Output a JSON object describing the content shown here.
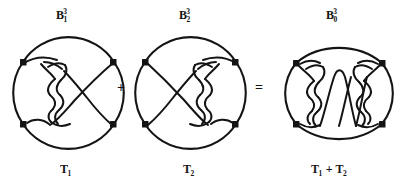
{
  "figure": {
    "kind": "knot-theory-tangle-addition-diagram",
    "background_color": "#ffffff",
    "ink_color": "#141414",
    "width": 417,
    "height": 181,
    "operators": [
      {
        "name": "plus-operator",
        "symbol": "+",
        "x": 117,
        "y": 81
      },
      {
        "name": "equals-operator",
        "symbol": "=",
        "x": 255,
        "y": 81
      }
    ],
    "panels": [
      {
        "id": "panel-1",
        "top_label": {
          "base": "B",
          "sub": "1",
          "sup": "3"
        },
        "bottom_label": {
          "base": "T",
          "sub": "1",
          "sup": ""
        },
        "shape": "circle",
        "cx": 69,
        "cy": 90,
        "rx": 54,
        "ry": 54,
        "endpoints": 4
      },
      {
        "id": "panel-2",
        "top_label": {
          "base": "B",
          "sub": "2",
          "sup": "3"
        },
        "bottom_label": {
          "base": "T",
          "sub": "2",
          "sup": ""
        },
        "shape": "circle",
        "cx": 191,
        "cy": 90,
        "rx": 54,
        "ry": 54,
        "endpoints": 4
      },
      {
        "id": "panel-3",
        "top_label": {
          "base": "B",
          "sub": "0",
          "sup": "3"
        },
        "bottom_label_text": "T₁ + T₂",
        "bottom_label_parts": [
          {
            "base": "T",
            "sub": "1"
          },
          {
            "op": " + "
          },
          {
            "base": "T",
            "sub": "2"
          }
        ],
        "shape": "ellipse",
        "cx": 339,
        "cy": 90,
        "rx": 62,
        "ry": 54,
        "endpoints": 4
      }
    ],
    "caption_alt": "Tangle T1 in ball B1 cubed plus tangle T2 in ball B2 cubed equals tangle T1 + T2 in ball B0 cubed"
  }
}
